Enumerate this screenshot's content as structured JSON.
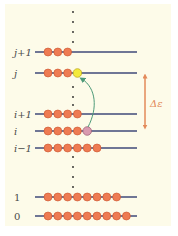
{
  "diagram": {
    "type": "energy-level-diagram",
    "colors": {
      "background_panel": "#fdfbe9",
      "level_line": "#3f4a78",
      "particle": "#ee7b52",
      "particle_edge": "#c9532d",
      "excited_particle_from": "#d99aaf",
      "excited_particle_to": "#f3ea3a",
      "arrow": "#4d9a78",
      "energy_gap_arrow": "#e38a5a",
      "label": "#4a4a4a"
    },
    "levels": [
      {
        "label": "j+1",
        "italic": true,
        "y": 52,
        "particles": 3,
        "extra": null
      },
      {
        "label": "j",
        "italic": true,
        "y": 73,
        "particles": 3,
        "extra": "yellow"
      },
      {
        "label": "i+1",
        "italic": true,
        "y": 114,
        "particles": 4,
        "extra": null
      },
      {
        "label": "i",
        "italic": true,
        "y": 131,
        "particles": 4,
        "extra": "pink"
      },
      {
        "label": "i−1",
        "italic": true,
        "y": 148,
        "particles": 6,
        "extra": null
      },
      {
        "label": "1",
        "italic": false,
        "y": 197,
        "particles": 8,
        "extra": null
      },
      {
        "label": "0",
        "italic": false,
        "y": 216,
        "particles": 9,
        "extra": null
      }
    ],
    "energy_gap_label": "Δε",
    "transition": {
      "from": "i",
      "to": "j"
    }
  }
}
